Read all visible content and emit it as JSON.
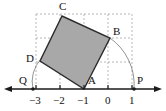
{
  "figure": {
    "colors": {
      "axis": "#1a1a1a",
      "square_fill": "#a8a8a8",
      "square_stroke": "#2b2b2b",
      "grid_dashed": "#9a9a9a",
      "arc": "#6e6e6e",
      "label": "#111111",
      "background": "#ffffff"
    },
    "axis": {
      "name": "number-line",
      "y_pixel": 89,
      "x_start": 6,
      "x_end": 160,
      "arrow_left": true,
      "arrow_right": true,
      "origin_x_pixel": 108,
      "unit_pixels": 24
    },
    "ticks": [
      {
        "label": "−3",
        "value": -3,
        "x": 36
      },
      {
        "label": "−2",
        "value": -2,
        "x": 60
      },
      {
        "label": "−1",
        "value": -1,
        "x": 84
      },
      {
        "label": "0",
        "value": 0,
        "x": 108
      },
      {
        "label": "1",
        "value": 1,
        "x": 132
      }
    ],
    "tick_label_y": 94,
    "points": [
      {
        "name": "A",
        "label": "A",
        "x": 84,
        "y": 89,
        "label_x": 88,
        "label_y": 76,
        "on_axis": true,
        "dot": false
      },
      {
        "name": "B",
        "label": "B",
        "x": 110,
        "y": 38,
        "label_x": 114,
        "label_y": 27,
        "on_axis": false,
        "dot": false
      },
      {
        "name": "C",
        "label": "C",
        "x": 62,
        "y": 16,
        "label_x": 59,
        "label_y": 2,
        "on_axis": false,
        "dot": false
      },
      {
        "name": "D",
        "label": "D",
        "x": 40,
        "y": 61,
        "label_x": 26,
        "label_y": 54,
        "on_axis": false,
        "dot": false
      },
      {
        "name": "P",
        "label": "P",
        "x": 134,
        "y": 89,
        "label_x": 137,
        "label_y": 76,
        "on_axis": true,
        "dot": true
      },
      {
        "name": "Q",
        "label": "Q",
        "x": 33,
        "y": 89,
        "label_x": 19,
        "label_y": 76,
        "on_axis": true,
        "dot": true
      }
    ],
    "square": {
      "name": "shaded-square-ABCD",
      "vertices": [
        {
          "label": "A",
          "x": 84,
          "y": 89
        },
        {
          "label": "B",
          "x": 110,
          "y": 38
        },
        {
          "label": "C",
          "x": 62,
          "y": 16
        },
        {
          "label": "D",
          "x": 40,
          "y": 61
        }
      ],
      "fill": "#a8a8a8",
      "stroke": "#2b2b2b"
    },
    "grid_lines": {
      "vertical_x": [
        36,
        60,
        84,
        108,
        132
      ],
      "horizontal_y": [
        14,
        38,
        62
      ],
      "x_min": 36,
      "x_max": 132,
      "y_min": 14,
      "y_max": 89,
      "dash": "2,2"
    },
    "arcs": [
      {
        "name": "arc-B-to-P",
        "from": "B",
        "to": "P",
        "center_x": 84,
        "center_y": 89,
        "radius": 50,
        "path": "M 110 38 A 57 57 0 0 1 134 89"
      },
      {
        "name": "arc-D-to-Q",
        "from": "D",
        "to": "Q",
        "center_x": 84,
        "center_y": 89,
        "radius": 50,
        "path": "M 40 61 A 33 33 0 0 0 33 89"
      }
    ]
  }
}
